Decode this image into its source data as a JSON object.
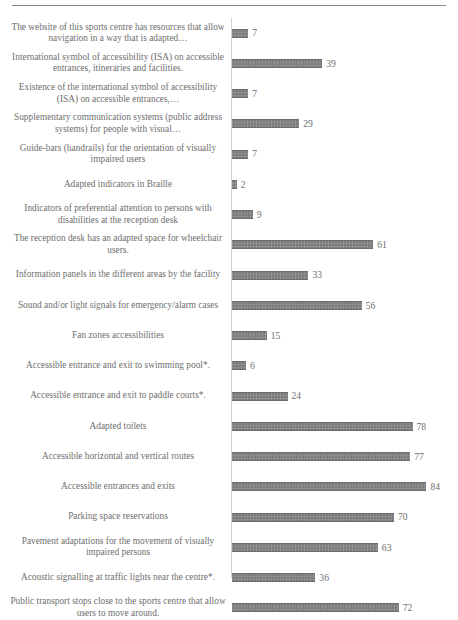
{
  "chart_data": {
    "type": "bar",
    "orientation": "horizontal",
    "title": "",
    "subtitle": "",
    "xlabel": "",
    "ylabel": "",
    "xlim": [
      0,
      90
    ],
    "grid": false,
    "legend": null,
    "bar_color": "#7a7a7a",
    "text_color": "#6e6e6e",
    "axis_color": "#d2d2d2",
    "categories": [
      "The website of this sports centre has resources that allow navigation in a way that is adapted…",
      "International symbol of accessibility (ISA) on accessible entrances, itineraries and facilities.",
      "Existence of the international symbol of accessibility (ISA) on accessible entrances,…",
      "Supplementary communication systems (public address systems) for people with visual…",
      "Guide-bars (handrails) for the orientation of visually impaired users",
      "Adapted indicators in Braille",
      "Indicators of preferential attention to persons with disabilities at the reception desk",
      "The reception desk has an adapted space for wheelchair users.",
      "Information panels in the different areas by the facility",
      "Sound and/or light signals for emergency/alarm cases",
      "Fan zones accessibilities",
      "Accessible entrance and exit to swimming pool*.",
      "Accessible entrance and exit to paddle courts*.",
      "Adapted toilets",
      "Accessible horizontal and vertical routes",
      "Accessible entrances and exits",
      "Parking space reservations",
      "Pavement adaptations for the movement of visually impaired persons",
      "Acoustic signalling at traffic lights near the centre*.",
      "Public transport stops close to the sports centre that allow users to move around."
    ],
    "values": [
      7,
      39,
      7,
      29,
      7,
      2,
      9,
      61,
      33,
      56,
      15,
      6,
      24,
      78,
      77,
      84,
      70,
      63,
      36,
      72
    ]
  }
}
